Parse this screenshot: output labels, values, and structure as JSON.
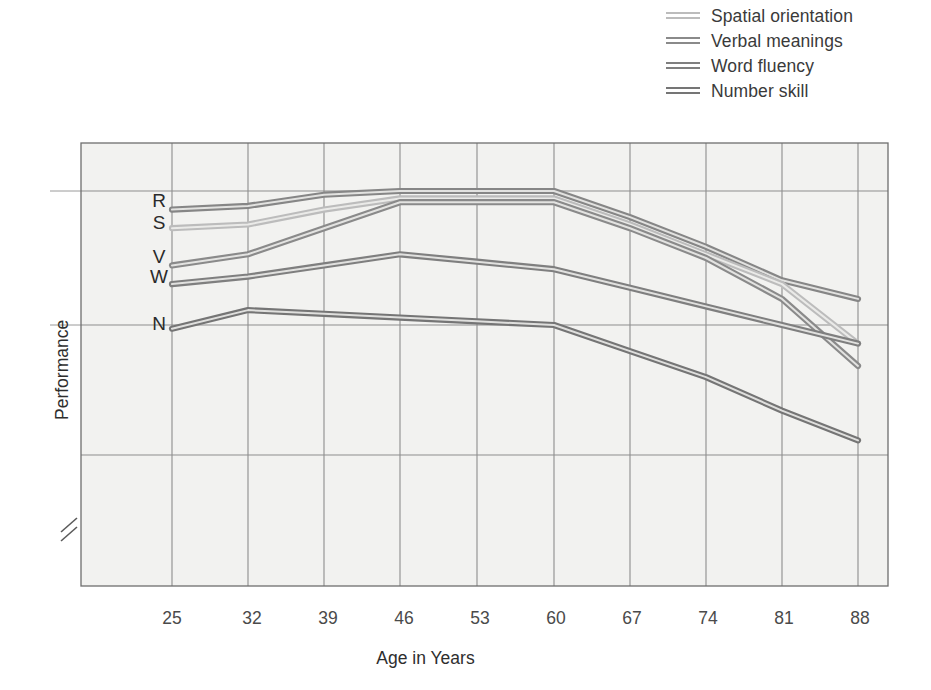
{
  "figure": {
    "background": "#ffffff",
    "plot_background": "#f2f2f0",
    "grid_color": "#8d8d8d",
    "frame_color": "#6e6e6e"
  },
  "legend": {
    "position": "top-right",
    "items": [
      {
        "label": "Spatial orientation",
        "color": "#b9b9b9",
        "swatch_name": "legend-swatch-spatial"
      },
      {
        "label": "Verbal meanings",
        "color": "#8a8a8a",
        "swatch_name": "legend-swatch-verbal"
      },
      {
        "label": "Word fluency",
        "color": "#7c7c7c",
        "swatch_name": "legend-swatch-word"
      },
      {
        "label": "Number skill",
        "color": "#737373",
        "swatch_name": "legend-swatch-number"
      }
    ]
  },
  "axes": {
    "x_title": "Age in Years",
    "y_title": "Performance",
    "x_ticks": [
      "25",
      "32",
      "39",
      "46",
      "53",
      "60",
      "67",
      "74",
      "81",
      "88"
    ],
    "y_series_labels": [
      "R",
      "S",
      "V",
      "W",
      "N"
    ],
    "y_axis_break": true
  },
  "chart_data": {
    "type": "line",
    "title": "",
    "subtitle": "",
    "xlabel": "Age in Years",
    "ylabel": "Performance",
    "x": [
      25,
      32,
      39,
      46,
      53,
      60,
      67,
      74,
      81,
      88
    ],
    "xlim": [
      25,
      88
    ],
    "ylim": [
      0,
      100
    ],
    "grid": true,
    "legend_position": "top-right",
    "note": "y values are relative performance scores read off the gridlines; higher = better performance. Axis is broken near the bottom (zero suppressed).",
    "y_start_labels": {
      "R": "Reasoning",
      "S": "Spatial orientation",
      "V": "Verbal meanings",
      "W": "Word fluency",
      "N": "Number skill"
    },
    "series": [
      {
        "name": "Reasoning",
        "code": "R",
        "color": "#868686",
        "values": [
          83,
          84,
          87,
          88,
          88,
          88,
          81,
          73,
          64,
          59
        ]
      },
      {
        "name": "Spatial orientation",
        "code": "S",
        "color": "#bcbcbc",
        "values": [
          78,
          79,
          83,
          86,
          86,
          86,
          79,
          71,
          63,
          47
        ]
      },
      {
        "name": "Verbal meanings",
        "code": "V",
        "color": "#8a8a8a",
        "values": [
          68,
          71,
          78,
          85,
          85,
          85,
          78,
          70,
          59,
          41
        ]
      },
      {
        "name": "Word fluency",
        "code": "W",
        "color": "#7f7f7f",
        "values": [
          63,
          65,
          68,
          71,
          69,
          67,
          62,
          57,
          52,
          47
        ]
      },
      {
        "name": "Number skill",
        "code": "N",
        "color": "#757575",
        "values": [
          51,
          56,
          55,
          54,
          53,
          52,
          45,
          38,
          29,
          21
        ]
      }
    ]
  }
}
